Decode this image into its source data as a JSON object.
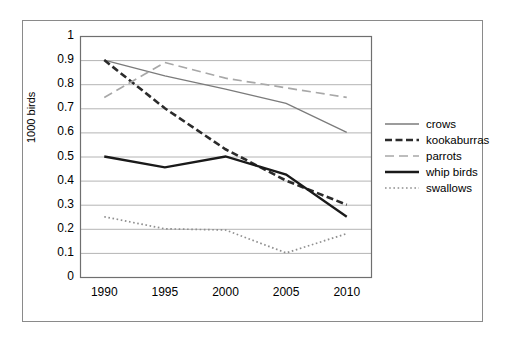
{
  "chart_data": {
    "type": "line",
    "title": "",
    "xlabel": "",
    "ylabel": "1000 birds",
    "x": [
      1990,
      1995,
      2000,
      2005,
      2010
    ],
    "xlim": [
      1988,
      2012
    ],
    "ylim": [
      0,
      1
    ],
    "ytick_labels": [
      "0",
      "0.1",
      "0.2",
      "0.3",
      "0.4",
      "0.5",
      "0.6",
      "0.7",
      "0.8",
      "0.9",
      "1"
    ],
    "xtick_labels": [
      "1990",
      "1995",
      "2000",
      "2005",
      "2010"
    ],
    "grid": "horizontal",
    "legend_position": "right",
    "series": [
      {
        "name": "crows",
        "style": "solid-thin",
        "color": "#7b7b7b",
        "values": [
          0.9,
          0.835,
          0.78,
          0.72,
          0.6
        ]
      },
      {
        "name": "kookaburras",
        "style": "dash-dot-bold",
        "color": "#2b2b2b",
        "values": [
          0.9,
          0.7,
          0.53,
          0.4,
          0.3
        ]
      },
      {
        "name": "parrots",
        "style": "long-dash",
        "color": "#a8a8a8",
        "values": [
          0.745,
          0.89,
          0.825,
          0.785,
          0.745
        ]
      },
      {
        "name": "whip birds",
        "style": "solid-bold",
        "color": "#1a1a1a",
        "values": [
          0.5,
          0.455,
          0.5,
          0.425,
          0.25
        ]
      },
      {
        "name": "swallows",
        "style": "dotted",
        "color": "#8f8f8f",
        "values": [
          0.25,
          0.2,
          0.195,
          0.1,
          0.18
        ]
      }
    ]
  },
  "axis": {
    "y_label_text": "1000 birds"
  },
  "legend": {
    "items": [
      {
        "label": "crows"
      },
      {
        "label": "kookaburras"
      },
      {
        "label": "parrots"
      },
      {
        "label": "whip birds"
      },
      {
        "label": "swallows"
      }
    ]
  },
  "colors": {
    "frame": "#8a8a8a",
    "gridline": "#b4b4b4",
    "axis": "#6f6f6f",
    "background": "#ffffff"
  }
}
